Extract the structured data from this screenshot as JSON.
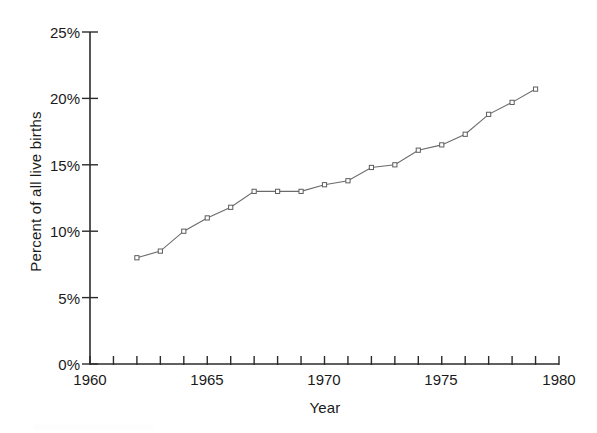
{
  "chart_data": {
    "type": "line",
    "title": "",
    "subtitle": "",
    "xlabel": "Year",
    "ylabel": "Percent of all live births",
    "xlim": [
      1960,
      1980
    ],
    "ylim": [
      0,
      25
    ],
    "xticks": [
      1960,
      1961,
      1962,
      1963,
      1964,
      1965,
      1966,
      1967,
      1968,
      1969,
      1970,
      1971,
      1972,
      1973,
      1974,
      1975,
      1976,
      1977,
      1978,
      1979,
      1980
    ],
    "xtick_labels": [
      "1960",
      "",
      "",
      "",
      "",
      "1965",
      "",
      "",
      "",
      "",
      "1970",
      "",
      "",
      "",
      "",
      "1975",
      "",
      "",
      "",
      "",
      "1980"
    ],
    "yticks": [
      0,
      5,
      10,
      15,
      20,
      25
    ],
    "ytick_labels": [
      "0%",
      "5%",
      "10%",
      "15%",
      "20%",
      "25%"
    ],
    "grid": false,
    "legend": false,
    "legend_position": "none",
    "marker": "open-square",
    "line_color": "#6b6b6b",
    "marker_fill": "#ffffff",
    "marker_edge": "#5d5d5d",
    "axis_color": "#2b2b2b",
    "x": [
      1962,
      1963,
      1964,
      1965,
      1966,
      1967,
      1968,
      1969,
      1970,
      1971,
      1972,
      1973,
      1974,
      1975,
      1976,
      1977,
      1978,
      1979
    ],
    "values": [
      8.0,
      8.5,
      10.0,
      11.0,
      11.8,
      13.0,
      13.0,
      13.0,
      13.5,
      13.8,
      14.8,
      15.0,
      16.1,
      16.5,
      17.3,
      18.8,
      19.7,
      20.7
    ],
    "series": [
      {
        "name": "Percent of all live births",
        "values": [
          8.0,
          8.5,
          10.0,
          11.0,
          11.8,
          13.0,
          13.0,
          13.0,
          13.5,
          13.8,
          14.8,
          15.0,
          16.1,
          16.5,
          17.3,
          18.8,
          19.7,
          20.7
        ]
      }
    ]
  },
  "axes": {
    "y_title": "Percent of all live births",
    "x_title": "Year",
    "y_tick_labels": [
      "25%",
      "20%",
      "15%",
      "10%",
      "5%",
      "0%"
    ],
    "x_tick_labels": [
      "1960",
      "1965",
      "1970",
      "1975",
      "1980"
    ]
  }
}
